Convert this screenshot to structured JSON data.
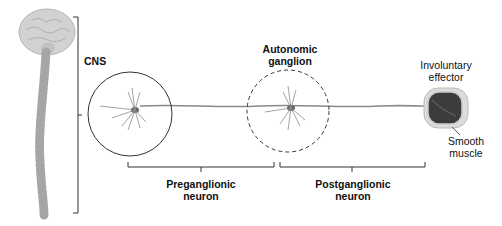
{
  "labels": {
    "cns": "CNS",
    "ganglion_line1": "Autonomic",
    "ganglion_line2": "ganglion",
    "effector_line1": "Involuntary",
    "effector_line2": "effector",
    "muscle_line1": "Smooth",
    "muscle_line2": "muscle",
    "pre_line1": "Preganglionic",
    "pre_line2": "neuron",
    "post_line1": "Postganglionic",
    "post_line2": "neuron"
  },
  "colors": {
    "outline": "#333333",
    "axon": "#8a8a8a",
    "brain": "#cfcfcf",
    "muscle_dark": "#3a3a3a",
    "muscle_light": "#d9d9d9"
  }
}
